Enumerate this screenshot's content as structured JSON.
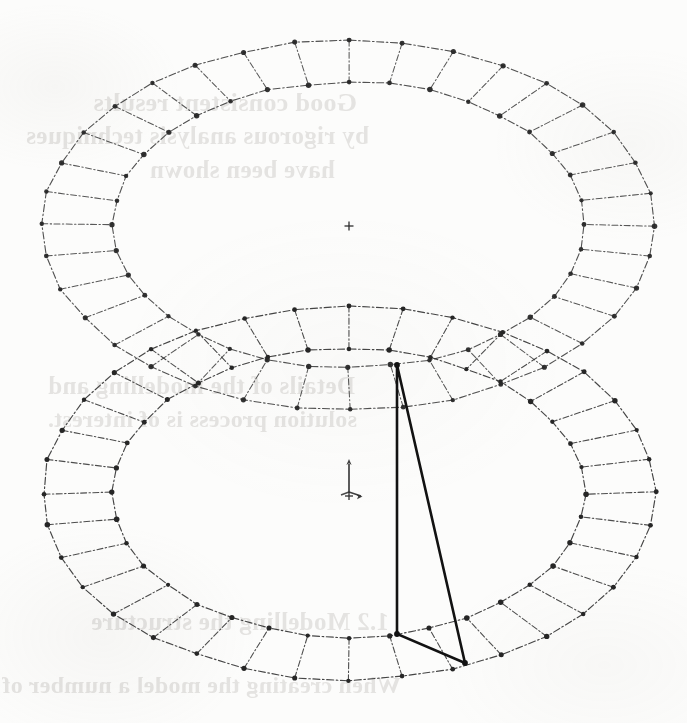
{
  "document": {
    "kind": "scanned-technical-drawing",
    "title": "Two concentric segmented ring assemblies with triangular overlay",
    "page_background_color": "#fcfcfb",
    "ink_color": "#2b2b2b",
    "bleed_text_color": "#4a4038"
  },
  "geometry": {
    "line_style": "dash-dot",
    "node_style": "filled-circle",
    "node_color": "#262626",
    "rings": [
      {
        "name": "upper-ring",
        "center": {
          "x": 349,
          "y": 225
        },
        "outer_rx": 306,
        "outer_ry": 185,
        "inner_rx": 236,
        "inner_ry": 143,
        "segments": 36,
        "spoke_count": 36,
        "stroke_width": 1.1,
        "opacity": 0.82
      },
      {
        "name": "lower-ring",
        "center": {
          "x": 349,
          "y": 493
        },
        "outer_rx": 306,
        "outer_ry": 187,
        "inner_rx": 236,
        "inner_ry": 144,
        "segments": 36,
        "spoke_count": 36,
        "stroke_width": 1.15,
        "opacity": 0.88
      }
    ],
    "triangle": {
      "name": "load-triangle",
      "stroke_width": 2.6,
      "stroke_color": "#121212",
      "vertices": [
        {
          "label": "apex",
          "x": 397,
          "y": 365
        },
        {
          "label": "lower-left",
          "x": 397,
          "y": 634
        },
        {
          "label": "lower-right",
          "x": 465,
          "y": 663
        }
      ]
    },
    "markers": [
      {
        "name": "upper-center-crosshair",
        "type": "crosshair",
        "x": 349,
        "y": 226,
        "size": 9
      },
      {
        "name": "lower-center-crosshair",
        "type": "crosshair",
        "x": 349,
        "y": 496,
        "size": 8
      },
      {
        "name": "coordinate-gnomon",
        "type": "axis-triad",
        "x": 349,
        "y": 480,
        "arrow_length": 22,
        "description": "three-axis orientation indicator"
      }
    ]
  },
  "bleed_through": {
    "note": "mirrored show-through text from the reverse side of the sheet; illegible",
    "lines": [
      {
        "text": "Good  consistent  results",
        "x": 330,
        "y": 88,
        "size": 26
      },
      {
        "text": "by  rigorous  analysis  techniques",
        "x": 318,
        "y": 122,
        "size": 25
      },
      {
        "text": "have  been  shown",
        "x": 352,
        "y": 156,
        "size": 25
      },
      {
        "text": "Details  of  the  modelling  and",
        "x": 332,
        "y": 372,
        "size": 25
      },
      {
        "text": "solution  process  is  of  interest.",
        "x": 330,
        "y": 406,
        "size": 24
      },
      {
        "text": "1.2   Modelling  the  structure",
        "x": 298,
        "y": 608,
        "size": 25
      },
      {
        "text": "When  creating  the  model  a  number  of",
        "x": 286,
        "y": 672,
        "size": 24
      }
    ]
  }
}
